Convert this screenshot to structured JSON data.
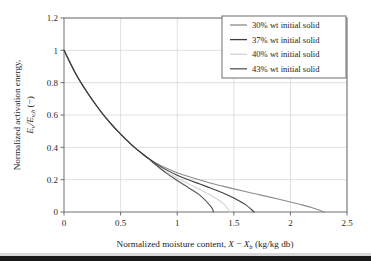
{
  "chart_data": {
    "type": "line",
    "title": "",
    "xlabel": "Normalized moisture content, X − X_b (kg/kg db)",
    "ylabel": "Normalized activation energy, E_v/E_v,b (−)",
    "xlim": [
      0,
      2.5
    ],
    "ylim": [
      0,
      1.2
    ],
    "xticks": [
      "0",
      "0.5",
      "1",
      "1.5",
      "2",
      "2.5"
    ],
    "xtick_values": [
      0,
      0.5,
      1,
      1.5,
      2,
      2.5
    ],
    "yticks": [
      "0",
      "0.2",
      "0.4",
      "0.6",
      "0.8",
      "1",
      "1.2"
    ],
    "ytick_values": [
      0,
      0.2,
      0.4,
      0.6,
      0.8,
      1,
      1.2
    ],
    "grid": true,
    "legend_position": "upper right",
    "series": [
      {
        "name": "30% wt initial solid",
        "color": "#8c8c8c",
        "x_intercept": 2.3,
        "points": [
          [
            0.0,
            1.0
          ],
          [
            0.1,
            0.86
          ],
          [
            0.2,
            0.745
          ],
          [
            0.3,
            0.645
          ],
          [
            0.4,
            0.557
          ],
          [
            0.5,
            0.481
          ],
          [
            0.6,
            0.414
          ],
          [
            0.7,
            0.356
          ],
          [
            0.75,
            0.33
          ],
          [
            0.8,
            0.308
          ],
          [
            0.9,
            0.272
          ],
          [
            1.0,
            0.243
          ],
          [
            1.1,
            0.219
          ],
          [
            1.2,
            0.198
          ],
          [
            1.3,
            0.178
          ],
          [
            1.4,
            0.16
          ],
          [
            1.5,
            0.143
          ],
          [
            1.6,
            0.127
          ],
          [
            1.7,
            0.111
          ],
          [
            1.8,
            0.095
          ],
          [
            1.9,
            0.079
          ],
          [
            2.0,
            0.062
          ],
          [
            2.1,
            0.044
          ],
          [
            2.2,
            0.025
          ],
          [
            2.3,
            0.0
          ]
        ]
      },
      {
        "name": "37% wt initial solid",
        "color": "#3f3f3f",
        "x_intercept": 1.68,
        "points": [
          [
            0.0,
            1.0
          ],
          [
            0.1,
            0.86
          ],
          [
            0.2,
            0.745
          ],
          [
            0.3,
            0.645
          ],
          [
            0.4,
            0.557
          ],
          [
            0.5,
            0.481
          ],
          [
            0.6,
            0.414
          ],
          [
            0.7,
            0.356
          ],
          [
            0.75,
            0.33
          ],
          [
            0.8,
            0.304
          ],
          [
            0.9,
            0.262
          ],
          [
            1.0,
            0.228
          ],
          [
            1.1,
            0.199
          ],
          [
            1.2,
            0.173
          ],
          [
            1.3,
            0.147
          ],
          [
            1.4,
            0.119
          ],
          [
            1.5,
            0.086
          ],
          [
            1.6,
            0.047
          ],
          [
            1.68,
            0.0
          ]
        ]
      },
      {
        "name": "40% wt initial solid",
        "color": "#d2d2d2",
        "x_intercept": 1.47,
        "points": [
          [
            0.0,
            1.0
          ],
          [
            0.1,
            0.86
          ],
          [
            0.2,
            0.745
          ],
          [
            0.3,
            0.645
          ],
          [
            0.4,
            0.557
          ],
          [
            0.5,
            0.481
          ],
          [
            0.6,
            0.414
          ],
          [
            0.7,
            0.356
          ],
          [
            0.75,
            0.33
          ],
          [
            0.8,
            0.301
          ],
          [
            0.9,
            0.251
          ],
          [
            1.0,
            0.21
          ],
          [
            1.1,
            0.174
          ],
          [
            1.2,
            0.139
          ],
          [
            1.3,
            0.102
          ],
          [
            1.4,
            0.056
          ],
          [
            1.47,
            0.0
          ]
        ]
      },
      {
        "name": "43% wt initial solid",
        "color": "#555555",
        "x_intercept": 1.32,
        "points": [
          [
            0.0,
            1.0
          ],
          [
            0.1,
            0.86
          ],
          [
            0.2,
            0.745
          ],
          [
            0.3,
            0.645
          ],
          [
            0.4,
            0.557
          ],
          [
            0.5,
            0.481
          ],
          [
            0.6,
            0.414
          ],
          [
            0.7,
            0.356
          ],
          [
            0.75,
            0.329
          ],
          [
            0.8,
            0.298
          ],
          [
            0.9,
            0.242
          ],
          [
            1.0,
            0.195
          ],
          [
            1.1,
            0.15
          ],
          [
            1.2,
            0.104
          ],
          [
            1.3,
            0.032
          ],
          [
            1.32,
            0.0
          ]
        ]
      }
    ]
  },
  "axes": {
    "ylabel_line1": "Normalized activation energy,",
    "ylabel_line2_main": "E",
    "ylabel_line2_sub1": "v",
    "ylabel_line2_slash": "/E",
    "ylabel_line2_sub2": "v,b",
    "ylabel_line2_tail": " (−)",
    "xlabel_main": "Normalized moisture content, ",
    "xlabel_x": "X",
    "xlabel_minus": " − ",
    "xlabel_xb": "X",
    "xlabel_xb_sub": "b",
    "xlabel_units": " (kg/kg db)"
  },
  "legend": {
    "entries": [
      {
        "label": "30% wt initial solid",
        "color": "#8c8c8c"
      },
      {
        "label": "37% wt initial solid",
        "color": "#3f3f3f"
      },
      {
        "label": "40% wt initial solid",
        "color": "#d2d2d2"
      },
      {
        "label": "43% wt initial solid",
        "color": "#555555"
      }
    ]
  },
  "style": {
    "grid_color": "#d9d9d9",
    "axis_color": "#6e6e6e",
    "text_color": "#1c1c1c",
    "background": "#ffffff",
    "footer_bar_color": "#1a1a1a"
  }
}
